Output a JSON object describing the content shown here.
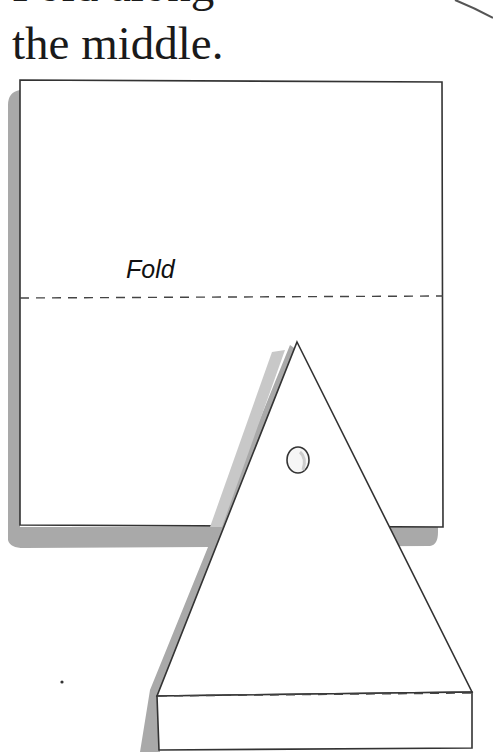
{
  "caption": {
    "line1": "Fold along",
    "line2": "the middle."
  },
  "illustration": {
    "square_fold_label": "Fold",
    "colors": {
      "paper": "#ffffff",
      "outline": "#333333",
      "shadow": "#a9a9a9",
      "text": "#1a1a1a"
    }
  }
}
